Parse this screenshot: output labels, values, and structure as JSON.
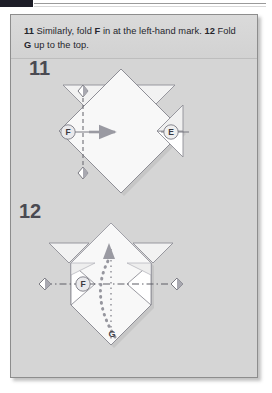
{
  "document": {
    "header_tab_color": "#1e1e28",
    "panel_bg_color": "#d5d5d5",
    "paper_color": "#f7f7f7",
    "ink_color": "#8c8c94"
  },
  "caption": {
    "step_11_number": "11",
    "step_11_text_a": " Similarly, fold ",
    "step_11_bold_label": "F",
    "step_11_text_b": " in at the left-hand mark. ",
    "step_12_number": "12",
    "step_12_text_a": " Fold ",
    "step_12_bold_label": "G",
    "step_12_text_b": " up to the top."
  },
  "diagrams": [
    {
      "id": "step-11",
      "step_label": "11",
      "description": "Diamond-shaped folded paper with two upper ear flaps and a right-side triangular flap; vertical dashed fold line on the left with diamond alignment marks and a gray arrow indicating the fold direction.",
      "labels": [
        {
          "name": "F",
          "text": "F",
          "style": "circled"
        },
        {
          "name": "E",
          "text": "E",
          "style": "circled"
        }
      ],
      "fold_line": {
        "orientation": "vertical",
        "style": "dashed"
      },
      "marks": [
        {
          "name": "top-alignment-diamond"
        },
        {
          "name": "bottom-alignment-diamond"
        },
        {
          "name": "left-vertex-diamond"
        }
      ],
      "arrow": {
        "name": "fold-direction-arrow",
        "direction": "right",
        "style": "solid"
      }
    },
    {
      "id": "step-12",
      "step_label": "12",
      "description": "Same model with left flap folded in; horizontal dash-dot crease line across the middle with diamond marks at both ends, and a curved dotted arrow sweeping from G at the bottom point up to the top point.",
      "labels": [
        {
          "name": "F",
          "text": "F",
          "style": "circled"
        },
        {
          "name": "G",
          "text": "G",
          "style": "plain"
        }
      ],
      "fold_line": {
        "orientation": "horizontal",
        "style": "dash-dot"
      },
      "marks": [
        {
          "name": "left-alignment-diamond"
        },
        {
          "name": "right-alignment-diamond"
        }
      ],
      "arrow": {
        "name": "fold-up-arrow",
        "direction": "up",
        "style": "dotted-curved"
      }
    }
  ]
}
